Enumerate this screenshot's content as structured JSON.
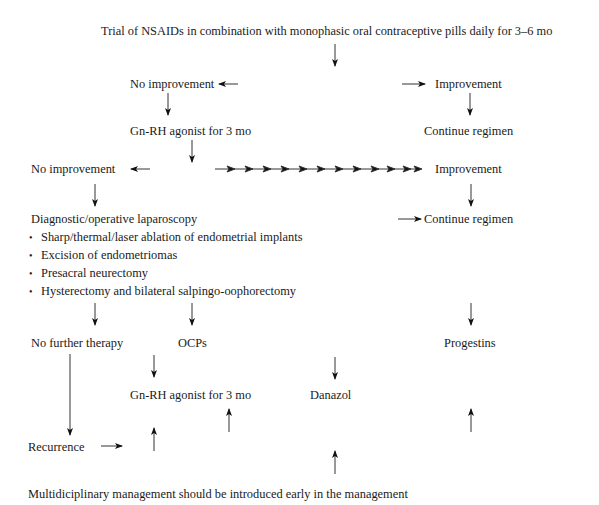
{
  "diagram": {
    "title": "Trial of NSAIDs in combination with monophasic oral contraceptive pills daily for 3–6 mo",
    "level1": {
      "no_improvement": "No improvement",
      "improvement": "Improvement",
      "gnrh": "Gn-RH agonist for 3 mo",
      "continue": "Continue regimen"
    },
    "level2": {
      "no_improvement": "No improvement",
      "improvement": "Improvement",
      "continue": "Continue regimen"
    },
    "laparoscopy": {
      "heading": "Diagnostic/operative laparoscopy",
      "items": [
        "Sharp/thermal/laser ablation of endometrial implants",
        "Excision of endometriomas",
        "Presacral neurectomy",
        "Hysterectomy and bilateral salpingo-oophorectomy"
      ]
    },
    "outcomes": {
      "no_further": "No further therapy",
      "ocps": "OCPs",
      "progestins": "Progestins",
      "gnrh2": "Gn-RH agonist for 3 mo",
      "danazol": "Danazol",
      "recurrence": "Recurrence"
    },
    "footer": "Multidiciplinary management should be introduced early in the management"
  }
}
